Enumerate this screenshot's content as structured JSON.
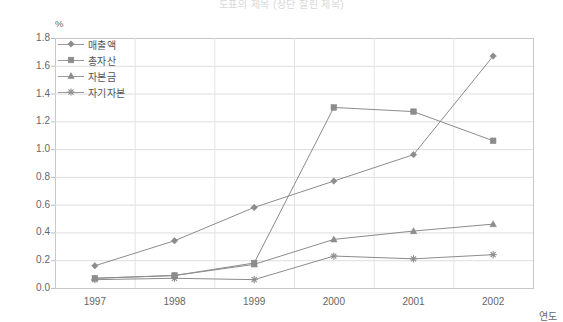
{
  "title": "도표의 제목 (상단 잘린 제목)",
  "unit_label": "%",
  "axis": {
    "x_name": "연도",
    "y_ticks": [
      "1.8",
      "1.6",
      "1.4",
      "1.2",
      "1.0",
      "0.8",
      "0.6",
      "0.4",
      "0.2",
      "0.0"
    ],
    "x_ticks": [
      "1997",
      "1998",
      "1999",
      "2000",
      "2001",
      "2002"
    ]
  },
  "legend": {
    "items": [
      {
        "label": "매출액",
        "marker": "diamond",
        "color": "#8c8c8c"
      },
      {
        "label": "총자산",
        "marker": "square",
        "color": "#8c8c8c"
      },
      {
        "label": "자본금",
        "marker": "triangle",
        "color": "#8c8c8c"
      },
      {
        "label": "자기자본",
        "marker": "star",
        "color": "#8c8c8c"
      }
    ]
  },
  "chart_data": {
    "type": "line",
    "title": "도표의 제목 (상단 잘린 제목)",
    "xlabel": "연도",
    "ylabel": "%",
    "categories": [
      "1997",
      "1998",
      "1999",
      "2000",
      "2001",
      "2002"
    ],
    "ylim": [
      0.0,
      1.8
    ],
    "ytick_step": 0.2,
    "grid": true,
    "legend_position": "upper-left-inside",
    "series": [
      {
        "name": "매출액",
        "marker": "diamond",
        "color": "#8c8c8c",
        "values": [
          0.16,
          0.34,
          0.58,
          0.77,
          0.96,
          1.67
        ]
      },
      {
        "name": "총자산",
        "marker": "square",
        "color": "#8c8c8c",
        "values": [
          0.07,
          0.09,
          0.18,
          1.3,
          1.27,
          1.06
        ]
      },
      {
        "name": "자본금",
        "marker": "triangle",
        "color": "#8c8c8c",
        "values": [
          0.07,
          0.09,
          0.17,
          0.35,
          0.41,
          0.46
        ]
      },
      {
        "name": "자기자본",
        "marker": "star",
        "color": "#8c8c8c",
        "values": [
          0.06,
          0.07,
          0.06,
          0.23,
          0.21,
          0.24
        ]
      }
    ]
  }
}
